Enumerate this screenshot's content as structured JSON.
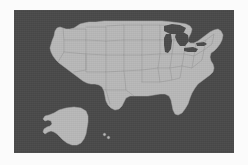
{
  "figure": {
    "type": "map",
    "projection": "albers-usa"
  },
  "colors": {
    "page_background": "#fbfbfb",
    "panel_background": "#4a4a4a",
    "land_fill": "#b8b8b8",
    "state_border": "#9a9a9a",
    "coast_outline": "#a8a8a8",
    "water": "#4a4a4a"
  },
  "panel": {
    "x": 14,
    "y": 10,
    "width": 220,
    "height": 143
  },
  "regions": [
    {
      "name": "contiguous-united-states",
      "label": "Lower 48"
    },
    {
      "name": "alaska",
      "label": "Alaska"
    },
    {
      "name": "hawaii",
      "label": "Hawaii"
    }
  ],
  "water_bodies": [
    {
      "name": "lake-superior",
      "label": "Lake Superior"
    },
    {
      "name": "lake-michigan",
      "label": "Lake Michigan"
    },
    {
      "name": "lake-huron",
      "label": "Lake Huron"
    },
    {
      "name": "lake-erie",
      "label": "Lake Erie"
    },
    {
      "name": "lake-ontario",
      "label": "Lake Ontario"
    }
  ],
  "geometry": {
    "mainland_path": "M 36 38 L 38 31 L 40 26 L 41 21 L 43 18 L 46 17 L 49 18 L 52 19 L 56 19 L 60 18 L 63 16 L 66 14 L 70 13 L 75 12 L 82 12 L 90 11 L 100 11 L 112 11 L 124 11 L 136 11 L 148 11 L 158 12 L 166 13 L 172 14 L 176 16 L 178 19 L 177 23 L 175 27 L 174 31 L 176 33 L 180 33 L 184 31 L 188 28 L 192 25 L 196 22 L 200 20 L 204 19 L 207 21 L 209 25 L 208 30 L 206 34 L 203 38 L 200 41 L 197 43 L 196 47 L 197 51 L 199 54 L 200 58 L 199 62 L 196 65 L 192 68 L 188 71 L 184 74 L 181 78 L 178 83 L 176 88 L 174 94 L 171 99 L 168 103 L 164 105 L 161 104 L 159 100 L 158 95 L 157 90 L 155 86 L 151 84 L 146 84 L 140 85 L 134 86 L 128 86 L 122 86 L 116 86 L 112 88 L 110 92 L 108 96 L 105 99 L 101 100 L 97 98 L 94 95 L 92 91 L 91 86 L 90 81 L 88 77 L 85 75 L 81 74 L 77 74 L 73 73 L 69 71 L 65 68 L 61 65 L 57 62 L 53 59 L 49 56 L 45 53 L 42 50 L 39 46 L 37 42 Z",
    "alaska_path": "M 40 103 L 45 100 L 52 98 L 60 97 L 67 98 L 72 101 L 74 106 L 74 112 L 73 118 L 72 124 L 70 129 L 67 133 L 63 135 L 58 135 L 53 133 L 49 130 L 46 127 L 43 124 L 40 122 L 37 121 L 34 122 L 31 124 L 29 122 L 30 119 L 33 117 L 36 116 L 38 114 L 37 111 L 34 110 L 31 111 L 29 109 L 31 106 L 35 105 Z",
    "hawaii_path": "M 89 124 L 91 123 L 92 125 L 90 126 Z M 93 127 L 95 126 L 96 128 L 94 129 Z",
    "state_borders": [
      "M 49 18 L 50 30 L 50 42",
      "M 50 42 L 72 44 L 72 30 L 50 30",
      "M 72 30 L 72 19 L 56 19",
      "M 72 44 L 72 60 L 60 62",
      "M 50 42 L 44 52",
      "M 72 44 L 92 45 L 92 31 L 72 30",
      "M 92 31 L 92 17 L 72 17",
      "M 92 45 L 92 62 L 72 62 L 72 44",
      "M 92 62 L 92 80 L 76 78",
      "M 92 45 L 110 45 L 110 30 L 92 31",
      "M 110 30 L 110 15 L 92 16",
      "M 110 45 L 110 61 L 92 62",
      "M 110 61 L 112 80 L 92 80",
      "M 110 30 L 128 30 L 128 15 L 110 15",
      "M 128 30 L 128 45 L 110 45",
      "M 128 45 L 128 60 L 110 61",
      "M 128 15 L 146 15 L 146 30 L 128 30",
      "M 146 30 L 146 44 L 128 45",
      "M 146 44 L 144 58 L 128 60",
      "M 146 15 L 160 16 L 160 30 L 146 30",
      "M 160 30 L 158 44 L 146 44",
      "M 158 44 L 156 58 L 144 58",
      "M 144 58 L 146 72 L 128 72",
      "M 128 60 L 128 72",
      "M 156 58 L 158 70 L 146 72",
      "M 160 30 L 172 32 L 170 44 L 158 44",
      "M 170 44 L 168 56 L 156 58",
      "M 168 56 L 166 68 L 158 70",
      "M 172 32 L 182 34 L 180 46 L 170 44",
      "M 180 46 L 178 58 L 168 56",
      "M 182 34 L 192 30 L 190 40 L 180 46",
      "M 190 40 L 188 50 L 178 58",
      "M 192 30 L 200 24 L 198 34 L 190 40",
      "M 112 80 L 120 86",
      "M 92 80 L 96 94"
    ]
  },
  "labels": {
    "none_visible": true
  }
}
